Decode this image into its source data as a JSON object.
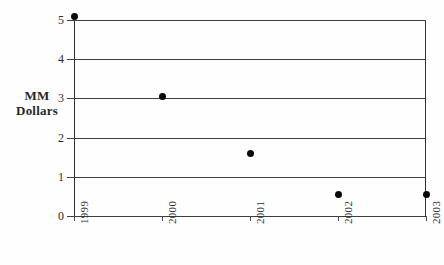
{
  "chart_data": {
    "type": "scatter",
    "title": "",
    "subtitle": "",
    "xlabel": "",
    "ylabel": "MM Dollars",
    "ylabel_lines": [
      "MM",
      "Dollars"
    ],
    "categories": [
      "1999",
      "2000",
      "2001",
      "2002",
      "2003"
    ],
    "values": [
      5.1,
      3.05,
      1.6,
      0.55,
      0.55
    ],
    "series": [
      {
        "name": "MM Dollars",
        "values": [
          5.1,
          3.05,
          1.6,
          0.55,
          0.55
        ]
      }
    ],
    "points": [
      {
        "x": "1999",
        "y": 5.1
      },
      {
        "x": "2000",
        "y": 3.05
      },
      {
        "x": "2001",
        "y": 1.6
      },
      {
        "x": "2002",
        "y": 0.55
      },
      {
        "x": "2003",
        "y": 0.55
      }
    ],
    "ylim": [
      0,
      5.3
    ],
    "xlim": [
      1999,
      2003
    ],
    "yticks": [
      0,
      1,
      2,
      3,
      4,
      5
    ],
    "ytick_labels": [
      "0",
      "1",
      "2",
      "3",
      "4",
      "5"
    ],
    "xtick_labels": [
      "1999",
      "2000",
      "2001",
      "2002",
      "2003"
    ],
    "xtick_rotation": -90,
    "grid": true,
    "grid_axis": "y",
    "legend": false,
    "legend_position": "none",
    "marker": "filled-circle",
    "marker_color": "#0a0a0a",
    "gridline_color": "#2b2b2b",
    "axis_color": "#1a1a1a",
    "background_color": "#ffffff"
  }
}
